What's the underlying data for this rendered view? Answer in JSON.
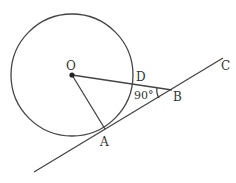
{
  "diagram": {
    "points": {
      "O": "O",
      "D": "D",
      "A": "A",
      "B": "B",
      "C": "C"
    },
    "angle_label": "90°",
    "colors": {
      "stroke": "#444444",
      "text": "#333333",
      "background": "#ffffff"
    }
  }
}
